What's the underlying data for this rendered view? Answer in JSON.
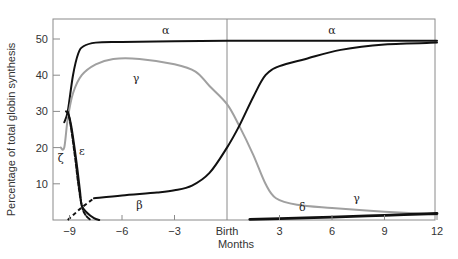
{
  "chart_data": {
    "type": "line",
    "title": "",
    "xlabel": "Months",
    "ylabel": "Percentage of total globin synthesis",
    "xlim": [
      -10,
      12
    ],
    "ylim": [
      0,
      55
    ],
    "grid": false,
    "x_ticks": [
      {
        "value": -9,
        "label": "−9"
      },
      {
        "value": -6,
        "label": "−6"
      },
      {
        "value": -3,
        "label": "−3"
      },
      {
        "value": 0,
        "label": "Birth"
      },
      {
        "value": 3,
        "label": "3"
      },
      {
        "value": 6,
        "label": "6"
      },
      {
        "value": 9,
        "label": "9"
      },
      {
        "value": 12,
        "label": "12"
      }
    ],
    "y_ticks": [
      {
        "value": 10,
        "label": "10"
      },
      {
        "value": 20,
        "label": "20"
      },
      {
        "value": 30,
        "label": "30"
      },
      {
        "value": 40,
        "label": "40"
      },
      {
        "value": 50,
        "label": "50"
      }
    ],
    "birth_marker": 0,
    "series": [
      {
        "name": "alpha",
        "label": "α",
        "color": "#111111",
        "style": "solid",
        "points": [
          [
            -9.3,
            27
          ],
          [
            -9.1,
            30
          ],
          [
            -8.8,
            40
          ],
          [
            -8.5,
            46
          ],
          [
            -8.2,
            48
          ],
          [
            -7.5,
            49
          ],
          [
            -6,
            49.2
          ],
          [
            -3,
            49.4
          ],
          [
            0,
            49.5
          ],
          [
            3,
            49.5
          ],
          [
            6,
            49.5
          ],
          [
            9,
            49.5
          ],
          [
            12,
            49.5
          ]
        ],
        "label_positions": [
          [
            -3.5,
            51.5
          ],
          [
            6,
            51.5
          ]
        ]
      },
      {
        "name": "gamma",
        "label": "γ",
        "color": "#a0a0a0",
        "style": "solid",
        "points": [
          [
            -9.5,
            20
          ],
          [
            -9.3,
            20
          ],
          [
            -9.1,
            28
          ],
          [
            -8.8,
            35
          ],
          [
            -8.3,
            40
          ],
          [
            -7.5,
            43
          ],
          [
            -6.5,
            44.5
          ],
          [
            -5,
            44.5
          ],
          [
            -3,
            43
          ],
          [
            -1.8,
            41
          ],
          [
            -1,
            37
          ],
          [
            0,
            32
          ],
          [
            0.7,
            26
          ],
          [
            1.5,
            18
          ],
          [
            2.2,
            10
          ],
          [
            2.8,
            6
          ],
          [
            4,
            4.2
          ],
          [
            6,
            3.3
          ],
          [
            9,
            2.3
          ],
          [
            12,
            1.5
          ]
        ],
        "label_positions": [
          [
            -5.2,
            38
          ],
          [
            7.4,
            5
          ]
        ]
      },
      {
        "name": "zeta",
        "label": "ζ",
        "color": "#111111",
        "style": "dashed",
        "points": [
          [
            -9.2,
            30
          ],
          [
            -9,
            28
          ],
          [
            -8.7,
            18
          ],
          [
            -8.5,
            10
          ],
          [
            -8.3,
            4
          ],
          [
            -8.1,
            1.5
          ],
          [
            -7.8,
            0
          ]
        ],
        "label_positions": [
          [
            -9.5,
            16
          ]
        ]
      },
      {
        "name": "epsilon",
        "label": "ε",
        "color": "#111111",
        "style": "solid",
        "points": [
          [
            -9.1,
            30
          ],
          [
            -8.9,
            26
          ],
          [
            -8.6,
            16
          ],
          [
            -8.4,
            8
          ],
          [
            -8.3,
            4
          ],
          [
            -8,
            2
          ],
          [
            -7.6,
            0.5
          ],
          [
            -7.3,
            0
          ]
        ],
        "label_positions": [
          [
            -8.3,
            18
          ]
        ]
      },
      {
        "name": "beta",
        "label": "β",
        "color": "#111111",
        "style": "solid",
        "dashed_segment": [
          [
            -9.1,
            0
          ],
          [
            -8.3,
            3.5
          ],
          [
            -7.6,
            6
          ]
        ],
        "points": [
          [
            -7.6,
            6
          ],
          [
            -6,
            6.8
          ],
          [
            -4,
            7.6
          ],
          [
            -3,
            8.2
          ],
          [
            -2,
            9.5
          ],
          [
            -1,
            13
          ],
          [
            0,
            20
          ],
          [
            0.7,
            26
          ],
          [
            1.5,
            34
          ],
          [
            2.2,
            40
          ],
          [
            3,
            42.5
          ],
          [
            4.5,
            44.5
          ],
          [
            6.5,
            47
          ],
          [
            9,
            48.5
          ],
          [
            12,
            49
          ]
        ],
        "label_positions": [
          [
            -5,
            3
          ]
        ]
      },
      {
        "name": "delta",
        "label": "δ",
        "color": "#111111",
        "style": "solid",
        "points": [
          [
            1.3,
            0.2
          ],
          [
            3,
            0.4
          ],
          [
            6,
            0.8
          ],
          [
            9,
            1.3
          ],
          [
            12,
            1.8
          ]
        ],
        "label_positions": [
          [
            4.3,
            2.5
          ]
        ]
      }
    ]
  }
}
